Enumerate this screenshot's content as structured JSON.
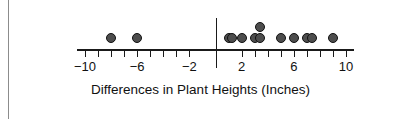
{
  "chart_data": {
    "type": "scatter",
    "plot_style": "dot-plot",
    "title": "",
    "xlabel": "Differences in Plant Heights (Inches)",
    "ylabel": "",
    "xlim": [
      -11,
      11
    ],
    "grid": false,
    "legend": null,
    "tick_step": 1,
    "labeled_ticks": [
      {
        "value": -10,
        "label": "−10"
      },
      {
        "value": -6,
        "label": "−6"
      },
      {
        "value": -2,
        "label": "−2"
      },
      {
        "value": 2,
        "label": "2"
      },
      {
        "value": 6,
        "label": "6"
      },
      {
        "value": 10,
        "label": "10"
      }
    ],
    "all_tick_values": [
      -10,
      -9,
      -8,
      -7,
      -6,
      -5,
      -4,
      -3,
      -2,
      2,
      3,
      4,
      5,
      6,
      7,
      8,
      9,
      10
    ],
    "zero_reference_line": 0,
    "values": [
      -8,
      -6,
      1,
      1.3,
      2,
      3,
      3.4,
      3.4,
      5,
      6,
      7,
      7.4,
      9
    ],
    "points": [
      {
        "x": -8,
        "stack": 1
      },
      {
        "x": -6,
        "stack": 1
      },
      {
        "x": 1,
        "stack": 1
      },
      {
        "x": 1.3,
        "stack": 1
      },
      {
        "x": 2,
        "stack": 1
      },
      {
        "x": 3,
        "stack": 1
      },
      {
        "x": 3.4,
        "stack": 1
      },
      {
        "x": 3.4,
        "stack": 2
      },
      {
        "x": 5,
        "stack": 1
      },
      {
        "x": 6,
        "stack": 1
      },
      {
        "x": 7,
        "stack": 1
      },
      {
        "x": 7.4,
        "stack": 1
      },
      {
        "x": 9,
        "stack": 1
      }
    ],
    "count": 13,
    "colors": {
      "dot_fill": "#4d4d4d",
      "dot_stroke": "#111111",
      "axis": "#1a1a1a",
      "text": "#111111",
      "background": "#ffffff",
      "page_rule": "#8c8c8c"
    }
  }
}
